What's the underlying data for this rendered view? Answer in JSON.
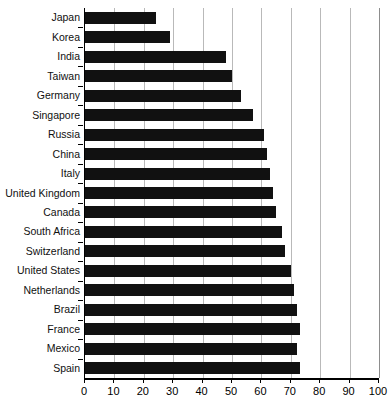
{
  "chart_data": {
    "type": "bar",
    "orientation": "horizontal",
    "title": "",
    "xlabel": "",
    "ylabel": "",
    "xlim": [
      0,
      100
    ],
    "xticks": [
      0,
      10,
      20,
      30,
      40,
      50,
      60,
      70,
      80,
      90,
      100
    ],
    "grid": true,
    "legend": false,
    "bar_color": "#111111",
    "grid_color": "#b9b9b9",
    "axis_color": "#000000",
    "categories": [
      "Japan",
      "Korea",
      "India",
      "Taiwan",
      "Germany",
      "Singapore",
      "Russia",
      "China",
      "Italy",
      "United Kingdom",
      "Canada",
      "South Africa",
      "Switzerland",
      "United States",
      "Netherlands",
      "Brazil",
      "France",
      "Mexico",
      "Spain"
    ],
    "values": [
      24,
      29,
      48,
      50,
      53,
      57,
      61,
      62,
      63,
      64,
      65,
      67,
      68,
      70,
      71,
      72,
      73,
      72,
      73
    ]
  }
}
